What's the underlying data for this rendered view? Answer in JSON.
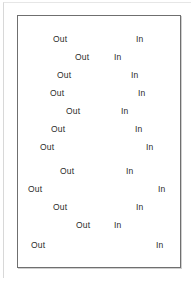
{
  "panel": {
    "name": "out-in-pattern-panel",
    "border_color": "#6f6f6f",
    "background_color": "#ffffff",
    "text_color": "#2b2b2b"
  },
  "labels": {
    "out": "Out",
    "in": "In"
  },
  "rows": [
    {
      "index": 1,
      "out_label": "Out",
      "in_label": "In",
      "out_x": 35,
      "in_x": 118,
      "y": 14
    },
    {
      "index": 2,
      "out_label": "Out",
      "in_label": "In",
      "out_x": 57,
      "in_x": 96,
      "y": 32
    },
    {
      "index": 3,
      "out_label": "Out",
      "in_label": "In",
      "out_x": 39,
      "in_x": 113,
      "y": 50
    },
    {
      "index": 4,
      "out_label": "Out",
      "in_label": "In",
      "out_x": 32,
      "in_x": 120,
      "y": 68
    },
    {
      "index": 5,
      "out_label": "Out",
      "in_label": "In",
      "out_x": 48,
      "in_x": 103,
      "y": 86
    },
    {
      "index": 6,
      "out_label": "Out",
      "in_label": "In",
      "out_x": 33,
      "in_x": 117,
      "y": 104
    },
    {
      "index": 7,
      "out_label": "Out",
      "in_label": "In",
      "out_x": 22,
      "in_x": 128,
      "y": 122
    },
    {
      "index": 8,
      "out_label": "Out",
      "in_label": "In",
      "out_x": 42,
      "in_x": 108,
      "y": 146
    },
    {
      "index": 9,
      "out_label": "Out",
      "in_label": "In",
      "out_x": 10,
      "in_x": 140,
      "y": 164
    },
    {
      "index": 10,
      "out_label": "Out",
      "in_label": "In",
      "out_x": 35,
      "in_x": 118,
      "y": 182
    },
    {
      "index": 11,
      "out_label": "Out",
      "in_label": "In",
      "out_x": 58,
      "in_x": 96,
      "y": 200
    },
    {
      "index": 12,
      "out_label": "Out",
      "in_label": "In",
      "out_x": 13,
      "in_x": 138,
      "y": 220
    }
  ]
}
